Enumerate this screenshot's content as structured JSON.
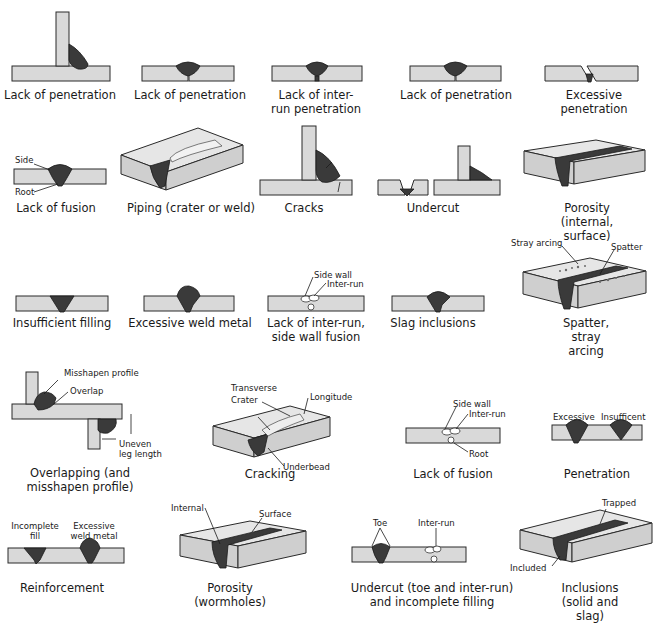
{
  "colors": {
    "plate": "#d9d9d9",
    "weld": "#3a3a3a",
    "outline": "#2a2a2a",
    "background": "#ffffff",
    "cavity": "#ffffff"
  },
  "figures": [
    {
      "id": "lack-of-penetration-tee",
      "caption": "Lack of penetration",
      "cx": 60,
      "cy": 96
    },
    {
      "id": "lack-of-penetration-butt-1",
      "caption": "Lack of penetration",
      "cx": 190,
      "cy": 96
    },
    {
      "id": "lack-of-inter-run-penetration",
      "caption": "Lack of inter-\nrun penetration",
      "cx": 316,
      "cy": 96
    },
    {
      "id": "lack-of-penetration-butt-2",
      "caption": "Lack of penetration",
      "cx": 456,
      "cy": 96
    },
    {
      "id": "excessive-penetration",
      "caption": "Excessive penetration",
      "cx": 594,
      "cy": 96
    },
    {
      "id": "lack-of-fusion-1",
      "caption": "Lack of fusion",
      "cx": 56,
      "cy": 209,
      "labels": [
        "Side",
        "Root"
      ]
    },
    {
      "id": "piping",
      "caption": "Piping (crater or weld)",
      "cx": 191,
      "cy": 209
    },
    {
      "id": "cracks",
      "caption": "Cracks",
      "cx": 304,
      "cy": 209
    },
    {
      "id": "undercut",
      "caption": "Undercut",
      "cx": 433,
      "cy": 209
    },
    {
      "id": "porosity-internal-surface",
      "caption": "Porosity\n(internal, surface)",
      "cx": 587,
      "cy": 209
    },
    {
      "id": "insufficient-filling",
      "caption": "Insufficient filling",
      "cx": 62,
      "cy": 316
    },
    {
      "id": "excessive-weld-metal",
      "caption": "Excessive weld metal",
      "cx": 190,
      "cy": 316
    },
    {
      "id": "lack-of-inter-run-side-wall-fusion",
      "caption": "Lack of inter-run,\nside wall fusion",
      "cx": 316,
      "cy": 316,
      "labels": [
        "Side wall",
        "Inter-run"
      ]
    },
    {
      "id": "slag-inclusions",
      "caption": "Slag inclusions",
      "cx": 433,
      "cy": 316
    },
    {
      "id": "spatter-stray-arcing",
      "caption": "Spatter, stray arcing",
      "cx": 586,
      "cy": 316,
      "labels": [
        "Stray arcing",
        "Spatter"
      ]
    },
    {
      "id": "overlapping",
      "caption": "Overlapping (and\nmisshapen profile)",
      "cx": 80,
      "cy": 545,
      "labels": [
        "Misshapen profile",
        "Overlap",
        "Uneven\nleg length"
      ]
    },
    {
      "id": "cracking",
      "caption": "Cracking",
      "cx": 270,
      "cy": 495,
      "labels": [
        "Transverse",
        "Crater",
        "Longitude",
        "Underbead"
      ]
    },
    {
      "id": "lack-of-fusion-2",
      "caption": "Lack of fusion",
      "cx": 453,
      "cy": 474,
      "labels": [
        "Side wall",
        "Inter-run",
        "Root"
      ]
    },
    {
      "id": "penetration",
      "caption": "Penetration",
      "cx": 597,
      "cy": 474,
      "labels": [
        "Excessive",
        "Insufficent"
      ]
    },
    {
      "id": "reinforcement",
      "caption": "Reinforcement",
      "cx": 62,
      "cy": 588,
      "labels": [
        "Incomplete\nfill",
        "Excessive\nweld metal"
      ]
    },
    {
      "id": "porosity-wormholes",
      "caption": "Porosity\n(wormholes)",
      "cx": 230,
      "cy": 588,
      "labels": [
        "Internal",
        "Surface"
      ]
    },
    {
      "id": "undercut-toe-inter-run",
      "caption": "Undercut (toe and inter-run)\nand incomplete filling",
      "cx": 432,
      "cy": 588,
      "labels": [
        "Toe",
        "Inter-run"
      ]
    },
    {
      "id": "inclusions",
      "caption": "Inclusions (solid and slag)",
      "cx": 590,
      "cy": 588,
      "labels": [
        "Trapped",
        "Included"
      ]
    }
  ]
}
